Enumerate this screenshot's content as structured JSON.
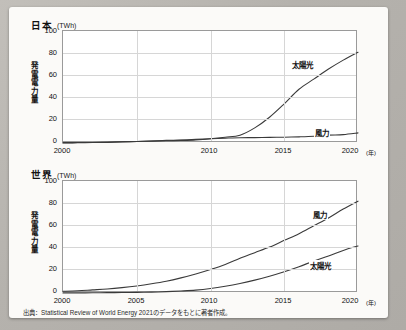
{
  "figure": {
    "source_note": "出典：Statistical Review of World Energy 2021のデータをもとに著者作成。"
  },
  "chart_data": [
    {
      "type": "line",
      "title": "日本",
      "ylabel": "発電電力量",
      "unit_label": "(TWh)",
      "xlabel": "(年)",
      "xlim": [
        2000,
        2020
      ],
      "ylim": [
        0,
        100
      ],
      "yticks": [
        0,
        20,
        40,
        60,
        80,
        100
      ],
      "xticks": [
        2000,
        2010,
        2015,
        2020
      ],
      "xgridlines": [
        2005,
        2010,
        2015
      ],
      "grid": true,
      "legend_position": "inline-right",
      "x": [
        2000,
        2001,
        2002,
        2003,
        2004,
        2005,
        2006,
        2007,
        2008,
        2009,
        2010,
        2011,
        2012,
        2013,
        2014,
        2015,
        2016,
        2017,
        2018,
        2019,
        2020
      ],
      "series": [
        {
          "name": "太陽光",
          "values": [
            0.3,
            0.4,
            0.5,
            0.7,
            1.1,
            1.4,
            1.7,
            2.0,
            2.3,
            2.8,
            3.8,
            5.2,
            7.0,
            13.5,
            23.0,
            35.0,
            48.0,
            57.0,
            66.0,
            74.0,
            81.0
          ]
        },
        {
          "name": "風力",
          "values": [
            0.1,
            0.2,
            0.4,
            0.6,
            1.0,
            1.4,
            1.8,
            2.3,
            2.7,
            3.2,
            3.8,
            4.3,
            4.7,
            4.8,
            5.0,
            5.2,
            5.5,
            6.0,
            7.0,
            7.5,
            9.0
          ]
        }
      ]
    },
    {
      "type": "line",
      "title": "世界",
      "ylabel": "発電電力量",
      "unit_label": "(TWh)",
      "xlabel": "(年)",
      "xlim": [
        2000,
        2020
      ],
      "ylim": [
        0,
        100
      ],
      "yticks": [
        0,
        20,
        40,
        60,
        80,
        100
      ],
      "xticks": [
        2000,
        2005,
        2010,
        2015,
        2020
      ],
      "xgridlines": [
        2005,
        2010,
        2015
      ],
      "grid": true,
      "legend_position": "inline-right",
      "x": [
        2000,
        2001,
        2002,
        2003,
        2004,
        2005,
        2006,
        2007,
        2008,
        2009,
        2010,
        2011,
        2012,
        2013,
        2014,
        2015,
        2016,
        2017,
        2018,
        2019,
        2020
      ],
      "series": [
        {
          "name": "風力",
          "values": [
            1.5,
            2.0,
            2.8,
            3.6,
            4.8,
            6.3,
            8.2,
            10.5,
            13.5,
            17.0,
            21.0,
            25.5,
            31.0,
            36.0,
            41.0,
            47.0,
            53.0,
            60.0,
            67.0,
            75.0,
            82.0
          ]
        },
        {
          "name": "太陽光",
          "values": [
            0.1,
            0.1,
            0.2,
            0.3,
            0.4,
            0.6,
            0.8,
            1.2,
            1.8,
            2.6,
            4.0,
            6.0,
            8.5,
            11.5,
            15.0,
            19.0,
            23.5,
            28.5,
            33.0,
            38.0,
            42.0
          ]
        }
      ]
    }
  ]
}
